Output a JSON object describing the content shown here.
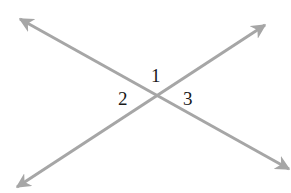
{
  "diagram": {
    "type": "intersecting-lines",
    "line_color": "#a6a6a6",
    "label_color": "#1a1a1a",
    "lines": [
      {
        "name": "line-a",
        "from": [
          20,
          19
        ],
        "to": [
          289,
          169
        ]
      },
      {
        "name": "line-b",
        "from": [
          17,
          187
        ],
        "to": [
          265,
          25
        ]
      }
    ],
    "intersection": [
      158,
      94
    ],
    "angles": [
      {
        "label": "1",
        "position": "top"
      },
      {
        "label": "2",
        "position": "left"
      },
      {
        "label": "3",
        "position": "right"
      }
    ]
  }
}
